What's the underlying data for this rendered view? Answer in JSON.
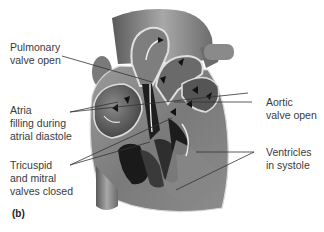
{
  "figure": {
    "panel_label": "(b)",
    "colors": {
      "background": "#ffffff",
      "text": "#3a3a3a",
      "leader_line": "#333333",
      "heart_dark": "#2a2a2a",
      "heart_mid": "#6e6e6e",
      "heart_light": "#b8b8b8",
      "heart_highlight": "#e2e2e2"
    },
    "labels": [
      {
        "id": "pulmonary",
        "text": "Pulmonary\nvalve open",
        "side": "left"
      },
      {
        "id": "atria",
        "text": "Atria\nfilling during\natrial diastole",
        "side": "left"
      },
      {
        "id": "tricuspid",
        "text": "Tricuspid\nand mitral\nvalves closed",
        "side": "left"
      },
      {
        "id": "aortic",
        "text": "Aortic\nvalve open",
        "side": "right"
      },
      {
        "id": "ventricles",
        "text": "Ventricles\nin systole",
        "side": "right"
      }
    ]
  }
}
